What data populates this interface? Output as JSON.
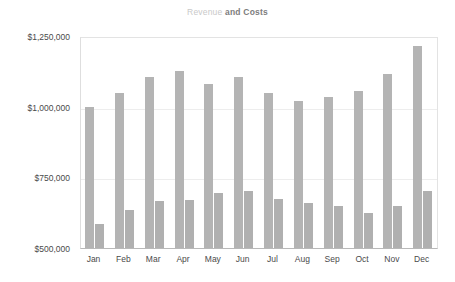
{
  "chart_data": {
    "type": "bar",
    "title_parts": [
      {
        "text": "Revenue",
        "color": "#c9c9c9",
        "weight": "normal"
      },
      {
        "text": "and Costs",
        "color": "#7d7d7d",
        "weight": "bold"
      }
    ],
    "xlabel": "",
    "ylabel": "",
    "categories": [
      "Jan",
      "Feb",
      "Mar",
      "Apr",
      "May",
      "Jun",
      "Jul",
      "Aug",
      "Sep",
      "Oct",
      "Nov",
      "Dec"
    ],
    "series": [
      {
        "name": "Revenue",
        "color": "#b4b4b4",
        "values": [
          1000000,
          1050000,
          1105000,
          1125000,
          1080000,
          1105000,
          1050000,
          1020000,
          1035000,
          1055000,
          1115000,
          1215000
        ]
      },
      {
        "name": "Costs",
        "color": "#b0b0b0",
        "values": [
          585000,
          635000,
          665000,
          670000,
          695000,
          700000,
          675000,
          660000,
          650000,
          625000,
          650000,
          700000
        ]
      }
    ],
    "ylim": [
      500000,
      1250000
    ],
    "ytick_values": [
      500000,
      750000,
      1000000,
      1250000
    ],
    "ytick_labels": [
      "$500,000",
      "$750,000",
      "$1,000,000",
      "$1,250,000"
    ],
    "grid": true,
    "grid_axis": "y",
    "legend": false,
    "legend_position": "none",
    "annotations": [],
    "plot_background": "#ffffff",
    "grid_color": "#ededed",
    "axis_color": "#b9b9b9"
  }
}
